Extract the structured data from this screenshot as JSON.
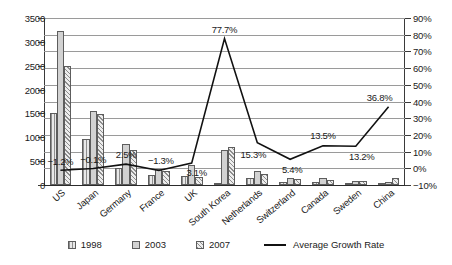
{
  "chart_data": {
    "type": "bar",
    "title": "",
    "subtitle": "",
    "xlabel": "",
    "ylabel": "",
    "grid": true,
    "legend_position": "bottom",
    "categories": [
      "US",
      "Japan",
      "Germany",
      "France",
      "UK",
      "South Korea",
      "Netherlands",
      "Switzerland",
      "Canada",
      "Sweden",
      "China"
    ],
    "series": [
      {
        "name": "1998",
        "axis": "left",
        "values": [
          1500,
          960,
          350,
          210,
          190,
          30,
          150,
          70,
          60,
          45,
          10
        ]
      },
      {
        "name": "2003",
        "axis": "left",
        "values": [
          3220,
          1560,
          870,
          330,
          420,
          740,
          290,
          150,
          140,
          90,
          55
        ]
      },
      {
        "name": "2007",
        "axis": "left",
        "values": [
          2500,
          1480,
          730,
          300,
          170,
          800,
          230,
          130,
          115,
          75,
          140
        ]
      },
      {
        "name": "Average Growth Rate",
        "axis": "right",
        "type": "line",
        "values": [
          -1.2,
          -0.1,
          2.5,
          -1.3,
          3.1,
          77.7,
          15.3,
          5.4,
          13.5,
          13.2,
          36.8
        ]
      }
    ],
    "data_labels": [
      "-1.2%",
      "-0.1%",
      "2.5%",
      "-1.3%",
      "3.1%",
      "77.7%",
      "15.3%",
      "5.4%",
      "13.5%",
      "13.2%",
      "36.8%"
    ],
    "left_axis": {
      "min": 0,
      "max": 3500,
      "step": 500,
      "ticks": [
        "0",
        "500",
        "1000",
        "1500",
        "2000",
        "2500",
        "3000",
        "3500"
      ]
    },
    "right_axis": {
      "min": -10,
      "max": 90,
      "step": 10,
      "ticks": [
        "-10%",
        "0%",
        "10%",
        "20%",
        "30%",
        "40%",
        "50%",
        "60%",
        "70%",
        "80%",
        "90%"
      ]
    },
    "colors": {
      "series_1998": "#d7d7d7",
      "series_2003": "#d2d2d2",
      "series_2007": "#e4e4e4",
      "line": "#111111",
      "grid": "#9a9a9a",
      "axis": "#3a3a3a",
      "text": "#1a1a1a",
      "background": "#ffffff"
    }
  },
  "legend": {
    "items": [
      {
        "label": "1998",
        "kind": "swatch-1998"
      },
      {
        "label": "2003",
        "kind": "swatch-2003"
      },
      {
        "label": "2007",
        "kind": "swatch-2007"
      },
      {
        "label": "Average Growth Rate",
        "kind": "line"
      }
    ]
  }
}
